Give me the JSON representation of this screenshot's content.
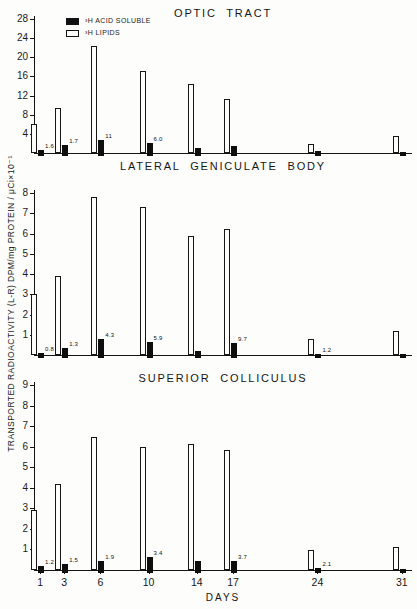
{
  "figure": {
    "background": "#fdfdfc",
    "ink": "#141414",
    "ylabel": "TRANSPORTED RADIOACTIVITY (L-R) DPM/mg PROTEIN / μCi×10⁻¹",
    "xlabel": "DAYS",
    "legend": {
      "position": "top-left",
      "items": [
        {
          "label": "³H ACID SOLUBLE",
          "swatch": "filled-black-square"
        },
        {
          "label": "³H LIPIDS",
          "swatch": "open-square"
        }
      ]
    }
  },
  "chart_data": [
    {
      "type": "bar",
      "title": "OPTIC TRACT",
      "xlabel": "DAYS",
      "categories": [
        1,
        3,
        6,
        10,
        14,
        17,
        24,
        31
      ],
      "ylim": [
        0,
        28
      ],
      "ytick_step": 4,
      "grid": false,
      "series": [
        {
          "name": "3H LIPIDS",
          "style": "open",
          "values": [
            6.0,
            9.3,
            22.3,
            17.2,
            14.4,
            11.3,
            1.8,
            3.5
          ]
        },
        {
          "name": "3H ACID SOLUBLE",
          "style": "filled",
          "values": [
            0.6,
            1.7,
            2.8,
            2.1,
            1.1,
            1.4,
            0.4,
            0.3
          ]
        }
      ],
      "bar_labels": [
        "1.6",
        "1.7",
        "11",
        "6.0",
        "",
        "",
        "",
        ""
      ]
    },
    {
      "type": "bar",
      "title": "LATERAL GENICULATE BODY",
      "xlabel": "DAYS",
      "categories": [
        1,
        3,
        6,
        10,
        14,
        17,
        24,
        31
      ],
      "ylim": [
        0,
        8
      ],
      "ytick_step": 1,
      "grid": false,
      "series": [
        {
          "name": "3H LIPIDS",
          "style": "open",
          "values": [
            3.0,
            3.9,
            7.8,
            7.3,
            5.9,
            6.2,
            0.8,
            1.2
          ]
        },
        {
          "name": "3H ACID SOLUBLE",
          "style": "filled",
          "values": [
            0.12,
            0.35,
            0.8,
            0.65,
            0.2,
            0.6,
            0.07,
            0.05
          ]
        }
      ],
      "bar_labels": [
        "0.8",
        "1.3",
        "4.3",
        "5.9",
        "",
        "9.7",
        "1.2",
        ""
      ]
    },
    {
      "type": "bar",
      "title": "SUPERIOR COLLICULUS",
      "xlabel": "DAYS",
      "categories": [
        1,
        3,
        6,
        10,
        14,
        17,
        24,
        31
      ],
      "ylim": [
        0,
        9
      ],
      "ytick_step": 1,
      "grid": false,
      "series": [
        {
          "name": "3H LIPIDS",
          "style": "open",
          "values": [
            2.9,
            4.2,
            6.45,
            6.0,
            6.15,
            5.85,
            0.95,
            1.1
          ]
        },
        {
          "name": "3H ACID SOLUBLE",
          "style": "filled",
          "values": [
            0.18,
            0.28,
            0.45,
            0.65,
            0.42,
            0.45,
            0.08,
            0.05
          ]
        }
      ],
      "bar_labels": [
        "1.2",
        "1.5",
        "1.9",
        "3.4",
        "",
        "3.7",
        "2.1",
        ""
      ]
    }
  ]
}
